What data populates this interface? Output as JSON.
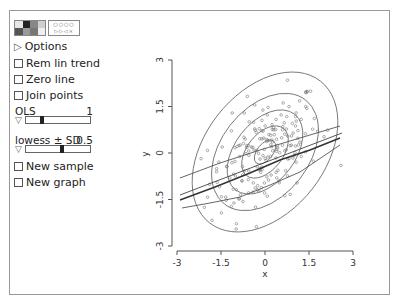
{
  "panel": {
    "palette_icon": "color-palette-icon",
    "symbol_icon": "point-symbol-icon",
    "palette_swatches": [
      "#e6e6e6",
      "#222222",
      "#888888",
      "#cfcfcf",
      "#555555",
      "#9a9a9a",
      "#777777",
      "#eeeeee"
    ],
    "options_label": "Options",
    "checkboxes": [
      {
        "label": "Rem lin trend",
        "checked": false
      },
      {
        "label": "Zero line",
        "checked": false
      },
      {
        "label": "Join points",
        "checked": false
      }
    ],
    "sliders": [
      {
        "label": "OLS",
        "value": "1",
        "thumb_pct": 22
      },
      {
        "label": "lowess ± SD",
        "value": "0.5",
        "thumb_pct": 52
      }
    ],
    "buttons": [
      {
        "label": "New sample",
        "checked": false
      },
      {
        "label": "New graph",
        "checked": false
      }
    ]
  },
  "chart_data": {
    "type": "scatter",
    "title": "",
    "xlabel": "x",
    "ylabel": "y",
    "xlim": [
      -3,
      3
    ],
    "ylim": [
      -3,
      3
    ],
    "xticks": [
      "-3",
      "-1.5",
      "0",
      "1.5",
      "3"
    ],
    "yticks": [
      "-3",
      "-1.5",
      "0",
      "1.5",
      "3"
    ],
    "grid": false,
    "legend": null,
    "overlays": {
      "contours": "bivariate normal density ellipses (5 levels), tilted positively, centered near (0,0)",
      "ols_line": {
        "intercept": 0.0,
        "slope": 0.5
      },
      "lowess_center": "approximately linear, slope ~0.45",
      "lowess_plus_sd": "parallel above centre line (+~0.6)",
      "lowess_minus_sd": "below centre line, flattening on left (-~0.6)"
    },
    "n_points_approx": 200,
    "points_description": "bivariate normal sample with positive correlation (~0.5), x and y roughly in [-2.5, 2.5]"
  }
}
